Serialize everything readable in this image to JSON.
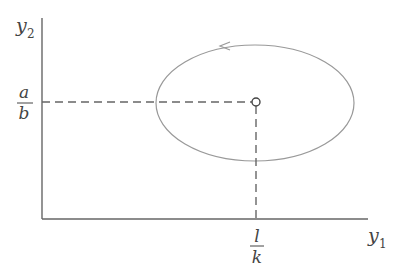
{
  "diagram": {
    "type": "phase-plane",
    "axes": {
      "x_label": "y",
      "x_label_sub": "1",
      "y_label": "y",
      "y_label_sub": "2"
    },
    "equilibrium": {
      "x_label_num": "l",
      "x_label_den": "k",
      "y_label_num": "a",
      "y_label_den": "b"
    },
    "orbit": {
      "shape": "ellipse",
      "direction": "counterclockwise"
    },
    "colors": {
      "axis": "#666666",
      "orbit": "#999999",
      "dashed": "#666666",
      "text": "#444444"
    }
  }
}
